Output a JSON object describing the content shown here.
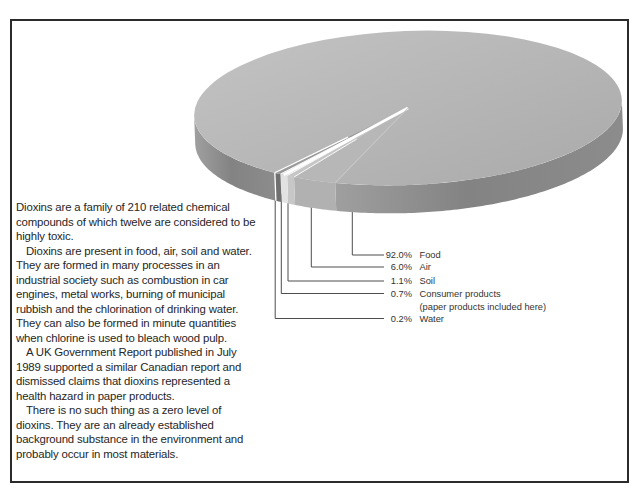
{
  "article": {
    "paragraphs": [
      "Dioxins are a family of 210 related chemical compounds of which twelve are considered to be highly toxic.",
      "Dioxins are present in food, air, soil and water. They are formed in many processes in an industrial society such as combustion in car engines, metal works, burning of municipal rubbish and the chlorination of drinking water. They can also be formed in minute quantities when chlorine is used to bleach wood pulp.",
      "A UK Government Report published in July 1989 supported a similar Canadian report and dismissed claims that dioxins represented a health hazard in paper products.",
      "There is no such thing as a zero level of dioxins. They are an already established background substance in the environment and probably occur in most materials."
    ]
  },
  "chart_data": {
    "type": "pie",
    "title": "",
    "unit": "%",
    "style": "3d grayscale pie, thin slices grouped at front-left with white divider, leader lines to labels",
    "legend_position": "leader lines to labels at lower left of pie",
    "slices": [
      {
        "key": "food",
        "label": "Food",
        "value": 92.0,
        "pct_label": "92.0%"
      },
      {
        "key": "air",
        "label": "Air",
        "value": 6.0,
        "pct_label": "6.0%"
      },
      {
        "key": "soil",
        "label": "Soil",
        "value": 1.1,
        "pct_label": "1.1%"
      },
      {
        "key": "consumer",
        "label": "Consumer  products",
        "value": 0.7,
        "pct_label": "0.7%",
        "note": "(paper products included here)"
      },
      {
        "key": "water",
        "label": "Water",
        "value": 0.2,
        "pct_label": "0.2%"
      }
    ]
  },
  "colors": {
    "frame_border": "#2b2b2b",
    "text": "#262626",
    "label_text": "#333333",
    "leader_line": "#4d4d4d",
    "top_gradient_light": "#c3c3c3",
    "top_gradient_dark": "#aaaaaa",
    "side_food_left": "#9f9f9f",
    "side_food_front": "#838383",
    "side_food_right": "#8c8c8c",
    "side_water": "#707070",
    "side_consumer": "#e2e2e2",
    "side_soil": "#c7c7c7",
    "side_air": "#b1b1b1",
    "top_water": "#9a9a9a",
    "top_consumer": "#dfdfdf",
    "top_soil": "#c6c6c6",
    "top_air": "#b7b7b7",
    "divider": "#ffffff",
    "faint_boundary": "#c8c8c8"
  }
}
